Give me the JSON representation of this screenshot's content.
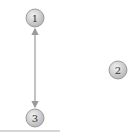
{
  "diagram": {
    "type": "node-graph",
    "nodes": [
      {
        "id": "1",
        "label": "1",
        "cx": 35,
        "cy": 18
      },
      {
        "id": "2",
        "label": "2",
        "cx": 118,
        "cy": 70
      },
      {
        "id": "3",
        "label": "3",
        "cx": 35,
        "cy": 118
      }
    ],
    "edges": [
      {
        "from": "1",
        "to": "3",
        "style": "double-arrow"
      }
    ],
    "baseline": {
      "x1": 0,
      "x2": 60,
      "y": 131
    },
    "colors": {
      "node_fill_light": "#f2f2f2",
      "node_fill_dark": "#b8b8b8",
      "node_stroke": "#8a8a8a",
      "edge": "#9a9a9a",
      "baseline": "#9a9a9a",
      "label": "#333333"
    }
  }
}
